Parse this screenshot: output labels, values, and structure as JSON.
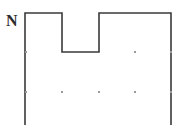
{
  "figure": {
    "type": "line-drawing",
    "background_color": "#ffffff",
    "stroke_color": "#3a3a3a",
    "stroke_width": 1.6,
    "dot_color": "#9a9a9a",
    "label_color": "#2b2b2b"
  },
  "labels": [
    {
      "id": "N",
      "text": "N",
      "x": 6,
      "y": 13,
      "font_size": 16
    }
  ],
  "outline": {
    "name": "notched-rectangle",
    "points": [
      [
        25,
        125
      ],
      [
        25,
        13
      ],
      [
        62,
        13
      ],
      [
        62,
        52
      ],
      [
        99,
        52
      ],
      [
        99,
        13
      ],
      [
        171,
        13
      ],
      [
        171,
        125
      ]
    ],
    "closed": false
  },
  "vertex_dots": [
    {
      "x": 26,
      "y": 52
    },
    {
      "x": 135,
      "y": 52
    },
    {
      "x": 171,
      "y": 52
    },
    {
      "x": 26,
      "y": 92
    },
    {
      "x": 62,
      "y": 92
    },
    {
      "x": 99,
      "y": 92
    },
    {
      "x": 135,
      "y": 92
    },
    {
      "x": 171,
      "y": 92
    }
  ],
  "canvas": {
    "width": 181,
    "height": 126
  }
}
